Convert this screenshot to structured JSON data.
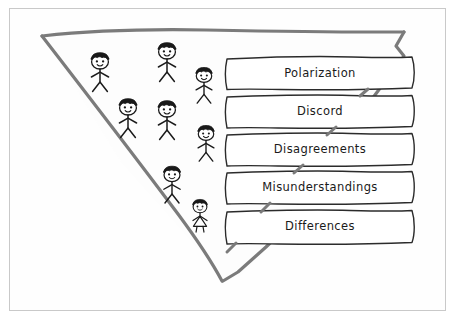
{
  "diagram": {
    "style": "hand-drawn sketch, black ink on white paper",
    "frame": {
      "name": "page-border",
      "color": "#c9c9c9"
    },
    "funnel": {
      "name": "inverted-triangle-funnel",
      "stroke_color": "#7b7b7b",
      "fill_color": "#fdfdfd",
      "stroke_width": 3.2,
      "apex": "bottom",
      "points": [
        [
          42,
          36
        ],
        [
          404,
          32
        ],
        [
          222,
          281
        ]
      ]
    },
    "labels": [
      {
        "text": "Polarization",
        "x": 226,
        "y": 57,
        "w": 188,
        "h": 31
      },
      {
        "text": "Discord",
        "x": 226,
        "y": 95,
        "w": 188,
        "h": 31
      },
      {
        "text": "Disagreements",
        "x": 226,
        "y": 133,
        "w": 188,
        "h": 31
      },
      {
        "text": "Misunderstandings",
        "x": 226,
        "y": 171,
        "w": 188,
        "h": 31
      },
      {
        "text": "Differences",
        "x": 226,
        "y": 210,
        "w": 188,
        "h": 31
      }
    ],
    "label_box_style": {
      "stroke_color": "#2b2b2b",
      "fill_color": "#ffffff",
      "stroke_width": 1.4
    },
    "people": [
      {
        "id": "person-1",
        "x": 100,
        "y": 62,
        "scale": 1.0,
        "type": "stick-figure",
        "hair": "dark",
        "dress": false
      },
      {
        "id": "person-2",
        "x": 167,
        "y": 52,
        "scale": 1.0,
        "type": "stick-figure",
        "hair": "dark",
        "dress": false
      },
      {
        "id": "person-3",
        "x": 204,
        "y": 76,
        "scale": 0.92,
        "type": "stick-figure",
        "hair": "dark",
        "dress": false
      },
      {
        "id": "person-4",
        "x": 128,
        "y": 108,
        "scale": 1.0,
        "type": "stick-figure",
        "hair": "dark",
        "dress": false
      },
      {
        "id": "person-5",
        "x": 167,
        "y": 110,
        "scale": 1.0,
        "type": "stick-figure",
        "hair": "dark",
        "dress": false
      },
      {
        "id": "person-6",
        "x": 206,
        "y": 134,
        "scale": 0.92,
        "type": "stick-figure",
        "hair": "dark",
        "dress": false
      },
      {
        "id": "person-7",
        "x": 172,
        "y": 175,
        "scale": 0.95,
        "type": "stick-figure",
        "hair": "dark",
        "dress": false
      },
      {
        "id": "person-8",
        "x": 200,
        "y": 207,
        "scale": 0.82,
        "type": "stick-figure",
        "hair": "long",
        "dress": true
      }
    ],
    "people_count": 8
  }
}
